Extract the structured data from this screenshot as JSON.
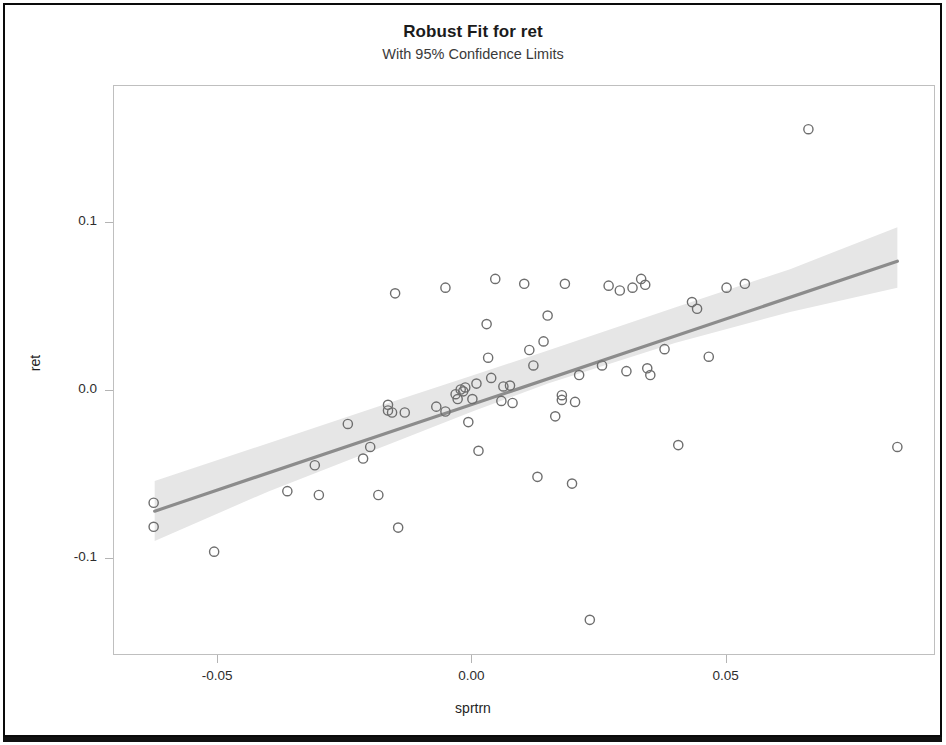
{
  "chart_data": {
    "type": "scatter",
    "title": "Robust Fit for ret",
    "subtitle": "With 95% Confidence Limits",
    "xlabel": "sprtrn",
    "ylabel": "ret",
    "xlim": [
      -0.0705,
      0.0912
    ],
    "ylim": [
      -0.1575,
      0.1817
    ],
    "xticks": [
      -0.05,
      0.0,
      0.05
    ],
    "xtick_labels": [
      "-0.05",
      "0.00",
      "0.05"
    ],
    "yticks": [
      -0.1,
      0.0,
      0.1
    ],
    "ytick_labels": [
      "-0.1",
      "0.0",
      "0.1"
    ],
    "grid": false,
    "legend": null,
    "marker": {
      "shape": "open-circle",
      "radius": 4.6,
      "stroke": "#6e6e6e",
      "stroke_width": 1.4,
      "fill": "none"
    },
    "fit_line": {
      "name": "Robust fit",
      "color": "#8c8c8c",
      "width": 3.2,
      "x_start": -0.0625,
      "x_end": 0.0836,
      "y_start": -0.0713,
      "y_end": 0.0774
    },
    "confidence_band": {
      "name": "95% Confidence Limits",
      "level": 0.95,
      "fill": "#e6e6e6",
      "x": [
        -0.0625,
        -0.04,
        -0.015,
        0.0,
        0.015,
        0.04,
        0.0625,
        0.0836
      ],
      "lower": [
        -0.089,
        -0.0594,
        -0.0298,
        -0.012,
        0.0048,
        0.0289,
        0.0472,
        0.0617
      ],
      "upper": [
        -0.0534,
        -0.0307,
        -0.0055,
        0.0094,
        0.0244,
        0.05,
        0.0727,
        0.0977
      ]
    },
    "points": [
      {
        "x": -0.0627,
        "y": -0.0663
      },
      {
        "x": -0.0627,
        "y": -0.0806
      },
      {
        "x": -0.0508,
        "y": -0.0954
      },
      {
        "x": -0.0364,
        "y": -0.0594
      },
      {
        "x": -0.031,
        "y": -0.044
      },
      {
        "x": -0.0302,
        "y": -0.0617
      },
      {
        "x": -0.0245,
        "y": -0.0194
      },
      {
        "x": -0.0215,
        "y": -0.04
      },
      {
        "x": -0.0201,
        "y": -0.0331
      },
      {
        "x": -0.0185,
        "y": -0.0617
      },
      {
        "x": -0.0166,
        "y": -0.0114
      },
      {
        "x": -0.0166,
        "y": -0.008
      },
      {
        "x": -0.0158,
        "y": -0.0126
      },
      {
        "x": -0.0152,
        "y": 0.0583
      },
      {
        "x": -0.0146,
        "y": -0.0811
      },
      {
        "x": -0.0133,
        "y": -0.0126
      },
      {
        "x": -0.0071,
        "y": -0.0091
      },
      {
        "x": -0.0053,
        "y": -0.012
      },
      {
        "x": -0.0053,
        "y": 0.0617
      },
      {
        "x": -0.0033,
        "y": -0.0017
      },
      {
        "x": -0.0029,
        "y": -0.0046
      },
      {
        "x": -0.0023,
        "y": 0.0011
      },
      {
        "x": -0.0018,
        "y": 0.0
      },
      {
        "x": -0.0014,
        "y": 0.0023
      },
      {
        "x": -0.0008,
        "y": -0.0183
      },
      {
        "x": 0.0,
        "y": -0.0046
      },
      {
        "x": 0.0008,
        "y": 0.0046
      },
      {
        "x": 0.0012,
        "y": -0.0354
      },
      {
        "x": 0.0028,
        "y": 0.04
      },
      {
        "x": 0.0031,
        "y": 0.02
      },
      {
        "x": 0.0037,
        "y": 0.008
      },
      {
        "x": 0.0045,
        "y": 0.0669
      },
      {
        "x": 0.0057,
        "y": -0.0057
      },
      {
        "x": 0.0061,
        "y": 0.0029
      },
      {
        "x": 0.0074,
        "y": 0.0034
      },
      {
        "x": 0.0079,
        "y": -0.0069
      },
      {
        "x": 0.0102,
        "y": 0.064
      },
      {
        "x": 0.0112,
        "y": 0.0246
      },
      {
        "x": 0.012,
        "y": 0.0154
      },
      {
        "x": 0.0128,
        "y": -0.0509
      },
      {
        "x": 0.014,
        "y": 0.0297
      },
      {
        "x": 0.0148,
        "y": 0.0451
      },
      {
        "x": 0.0163,
        "y": -0.0149
      },
      {
        "x": 0.0176,
        "y": -0.0023
      },
      {
        "x": 0.0176,
        "y": -0.0051
      },
      {
        "x": 0.0182,
        "y": 0.064
      },
      {
        "x": 0.0196,
        "y": -0.0549
      },
      {
        "x": 0.0202,
        "y": -0.0063
      },
      {
        "x": 0.021,
        "y": 0.0097
      },
      {
        "x": 0.0231,
        "y": -0.136
      },
      {
        "x": 0.0255,
        "y": 0.0154
      },
      {
        "x": 0.0268,
        "y": 0.0629
      },
      {
        "x": 0.029,
        "y": 0.06
      },
      {
        "x": 0.0303,
        "y": 0.012
      },
      {
        "x": 0.0315,
        "y": 0.0617
      },
      {
        "x": 0.0332,
        "y": 0.0669
      },
      {
        "x": 0.034,
        "y": 0.0634
      },
      {
        "x": 0.0344,
        "y": 0.0137
      },
      {
        "x": 0.035,
        "y": 0.0097
      },
      {
        "x": 0.0378,
        "y": 0.0251
      },
      {
        "x": 0.0405,
        "y": -0.032
      },
      {
        "x": 0.0432,
        "y": 0.0531
      },
      {
        "x": 0.0442,
        "y": 0.0491
      },
      {
        "x": 0.0465,
        "y": 0.0206
      },
      {
        "x": 0.05,
        "y": 0.0617
      },
      {
        "x": 0.0536,
        "y": 0.064
      },
      {
        "x": 0.0661,
        "y": 0.156
      },
      {
        "x": 0.0836,
        "y": -0.0331
      }
    ]
  },
  "axis": {
    "x_title": "sprtrn",
    "y_title": "ret",
    "x_tick_labels": [
      "-0.05",
      "0.00",
      "0.05"
    ],
    "y_tick_labels": [
      "0.1",
      "0.0",
      "-0.1"
    ]
  },
  "header": {
    "title": "Robust Fit for ret",
    "subtitle": "With 95% Confidence Limits"
  }
}
